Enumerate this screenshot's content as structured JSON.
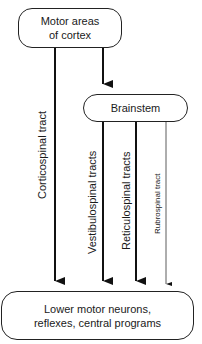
{
  "nodes": {
    "cortex": {
      "line1": "Motor areas",
      "line2": "of cortex"
    },
    "brainstem": {
      "label": "Brainstem"
    },
    "lower": {
      "line1": "Lower motor neurons,",
      "line2": "reflexes, central programs"
    }
  },
  "tracts": {
    "corticospinal": "Corticospinal tract",
    "vestibulospinal": "Vestibulospinal tracts",
    "reticulospinal": "Reticulospinal tracts",
    "rubrospinal": "Rubrospinal tract"
  }
}
